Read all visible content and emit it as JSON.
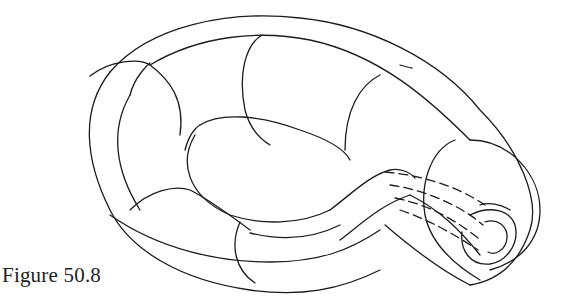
{
  "figure": {
    "caption": "Figure 50.8",
    "stroke_color": "#1c1c1c",
    "background": "#ffffff"
  }
}
